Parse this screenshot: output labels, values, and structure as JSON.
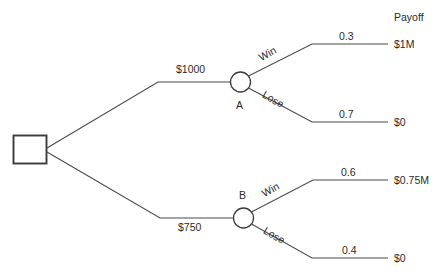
{
  "diagram": {
    "type": "decision-tree",
    "title_header": "Payoff",
    "root": {
      "name": "decision-node",
      "shape": "square"
    },
    "branches": [
      {
        "id": "branch-a",
        "cost_label": "$1000",
        "chance_node_label": "A",
        "outcomes": [
          {
            "id": "a-win",
            "outcome_label": "Win",
            "probability": "0.3",
            "payoff": "$1M"
          },
          {
            "id": "a-lose",
            "outcome_label": "Lose",
            "probability": "0.7",
            "payoff": "$0"
          }
        ]
      },
      {
        "id": "branch-b",
        "cost_label": "$750",
        "chance_node_label": "B",
        "outcomes": [
          {
            "id": "b-win",
            "outcome_label": "Win",
            "probability": "0.6",
            "payoff": "$0.75M"
          },
          {
            "id": "b-lose",
            "outcome_label": "Lose",
            "probability": "0.4",
            "payoff": "$0"
          }
        ]
      }
    ],
    "colors": {
      "line": "#4a4a4a",
      "node_stroke": "#3a3a3a",
      "text": "#2b2b2b",
      "background": "#ffffff"
    }
  }
}
